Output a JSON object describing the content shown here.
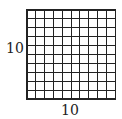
{
  "diagram": {
    "type": "grid",
    "rows": 10,
    "columns": 10,
    "left_label": "10",
    "bottom_label": "10",
    "line_color": "#222222",
    "background": "#ffffff"
  }
}
